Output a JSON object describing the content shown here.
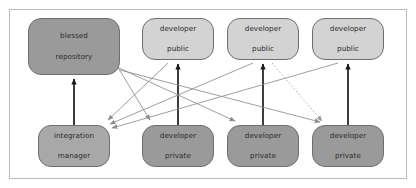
{
  "figure": {
    "background_color": "#ffffff",
    "frame_border_color": "#b9b9b9"
  },
  "palette": {
    "dark_node_fill": "#9a9a9a",
    "medium_node_fill": "#a8a8a8",
    "light_node_fill": "#d3d3d3",
    "node_border": "#6e6e6e",
    "thick_arrow": "#1a1a1a",
    "thin_arrow": "#8c8c8c",
    "dotted_arrow": "#9e9e9e",
    "text": "#2b2b2b"
  },
  "nodes": [
    {
      "id": "blessed-repository",
      "line1": "blessed",
      "line2": "repository",
      "style": "dark",
      "x": 28,
      "y": 18,
      "w": 92,
      "h": 57
    },
    {
      "id": "developer-public-1",
      "line1": "developer",
      "line2": "public",
      "style": "light",
      "x": 142,
      "y": 18,
      "w": 72,
      "h": 42
    },
    {
      "id": "developer-public-2",
      "line1": "developer",
      "line2": "public",
      "style": "light",
      "x": 227,
      "y": 18,
      "w": 72,
      "h": 42
    },
    {
      "id": "developer-public-3",
      "line1": "developer",
      "line2": "public",
      "style": "light",
      "x": 312,
      "y": 18,
      "w": 72,
      "h": 42
    },
    {
      "id": "integration-manager",
      "line1": "integration",
      "line2": "manager",
      "style": "medium",
      "x": 38,
      "y": 125,
      "w": 72,
      "h": 42
    },
    {
      "id": "developer-private-1",
      "line1": "developer",
      "line2": "private",
      "style": "dark",
      "x": 142,
      "y": 125,
      "w": 72,
      "h": 42
    },
    {
      "id": "developer-private-2",
      "line1": "developer",
      "line2": "private",
      "style": "dark",
      "x": 227,
      "y": 125,
      "w": 72,
      "h": 42
    },
    {
      "id": "developer-private-3",
      "line1": "developer",
      "line2": "private",
      "style": "dark",
      "x": 312,
      "y": 125,
      "w": 72,
      "h": 42
    }
  ],
  "edges": [
    {
      "id": "integration-manager-to-blessed-repository",
      "from": "integration-manager",
      "to": "blessed-repository",
      "kind": "thick-up"
    },
    {
      "id": "developer-private-1-to-developer-public-1",
      "from": "developer-private-1",
      "to": "developer-public-1",
      "kind": "thick-up"
    },
    {
      "id": "developer-private-2-to-developer-public-2",
      "from": "developer-private-2",
      "to": "developer-public-2",
      "kind": "thick-up"
    },
    {
      "id": "developer-private-3-to-developer-public-3",
      "from": "developer-private-3",
      "to": "developer-public-3",
      "kind": "thick-up"
    },
    {
      "id": "blessed-repository-to-developer-private-1",
      "from": "blessed-repository",
      "to": "developer-private-1",
      "kind": "thin"
    },
    {
      "id": "blessed-repository-to-developer-private-2",
      "from": "blessed-repository",
      "to": "developer-private-2",
      "kind": "thin"
    },
    {
      "id": "blessed-repository-to-developer-private-3",
      "from": "blessed-repository",
      "to": "developer-private-3",
      "kind": "thin"
    },
    {
      "id": "developer-public-1-to-integration-manager",
      "from": "developer-public-1",
      "to": "integration-manager",
      "kind": "thin"
    },
    {
      "id": "developer-public-2-to-integration-manager",
      "from": "developer-public-2",
      "to": "integration-manager",
      "kind": "thin"
    },
    {
      "id": "developer-public-3-to-integration-manager",
      "from": "developer-public-3",
      "to": "integration-manager",
      "kind": "thin"
    },
    {
      "id": "developer-public-2-to-developer-private-3",
      "from": "developer-public-2",
      "to": "developer-private-3",
      "kind": "dotted"
    }
  ]
}
